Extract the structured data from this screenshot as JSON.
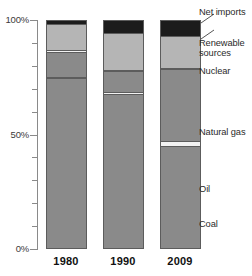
{
  "chart_data": {
    "type": "bar",
    "subtype": "stacked-100-percent",
    "title": "",
    "xlabel": "",
    "ylabel": "",
    "ylim": [
      0,
      100
    ],
    "y_unit": "%",
    "grid": false,
    "legend_position": "right-callouts",
    "categories": [
      "1980",
      "1990",
      "2009"
    ],
    "axis": {
      "tick_labels": [
        "100%",
        "50%",
        "0%"
      ],
      "tick_values": [
        100,
        50,
        0
      ],
      "minor_tick_values": [
        90,
        80,
        70,
        60,
        40,
        30,
        20,
        10
      ]
    },
    "stack_order_bottom_to_top": [
      "Coal",
      "Oil",
      "Natural gas",
      "Nuclear",
      "Renewable sources",
      "Net imports"
    ],
    "series": [
      {
        "name": "Coal",
        "values": [
          75,
          68,
          45
        ]
      },
      {
        "name": "Oil",
        "values": [
          0.5,
          0.8,
          2
        ]
      },
      {
        "name": "Natural gas",
        "values": [
          11,
          9,
          32
        ]
      },
      {
        "name": "Nuclear",
        "values": [
          0.5,
          0.5,
          0.5
        ]
      },
      {
        "name": "Renewable sources",
        "values": [
          11.5,
          16.2,
          14
        ]
      },
      {
        "name": "Net imports",
        "values": [
          1.5,
          5.5,
          6.5
        ]
      }
    ],
    "colors": {
      "Coal": "#8a8a8a",
      "Oil": "#f2f2f2",
      "Natural gas": "#8a8a8a",
      "Nuclear": "#f2f2f2",
      "Renewable sources": "#b5b5b5",
      "Net imports": "#1c1c1c",
      "axis": "#8a8a8a",
      "outline": "#5c5c5c",
      "text": "#2a2a2a"
    }
  },
  "axis_labels": {
    "top": "100%",
    "middle": "50%",
    "bottom": "0%"
  },
  "x_labels": {
    "b0": "1980",
    "b1": "1990",
    "b2": "2009"
  },
  "callouts": {
    "net_imports": "Net imports",
    "renewable": "Renewable",
    "renewable2": "sources",
    "nuclear": "Nuclear",
    "natural_gas": "Natural gas",
    "oil": "Oil",
    "coal": "Coal"
  }
}
